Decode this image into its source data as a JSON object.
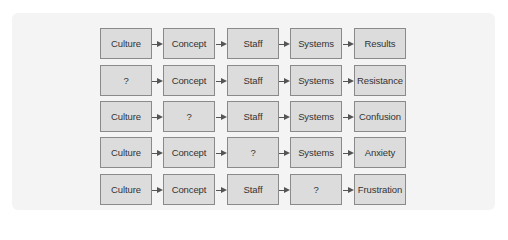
{
  "diagram": {
    "columns": [
      "Culture",
      "Concept",
      "Staff",
      "Systems",
      "Outcome"
    ],
    "rows": [
      {
        "cells": [
          "Culture",
          "Concept",
          "Staff",
          "Systems",
          "Results"
        ]
      },
      {
        "cells": [
          "?",
          "Concept",
          "Staff",
          "Systems",
          "Resistance"
        ]
      },
      {
        "cells": [
          "Culture",
          "?",
          "Staff",
          "Systems",
          "Confusion"
        ]
      },
      {
        "cells": [
          "Culture",
          "Concept",
          "?",
          "Systems",
          "Anxiety"
        ]
      },
      {
        "cells": [
          "Culture",
          "Concept",
          "Staff",
          "?",
          "Frustration"
        ]
      }
    ]
  },
  "colors": {
    "box_fill": "#dcdcdc",
    "box_border": "#8a8a8a",
    "arrow": "#555555",
    "text": "#333333",
    "backdrop": "#f4f4f4"
  }
}
